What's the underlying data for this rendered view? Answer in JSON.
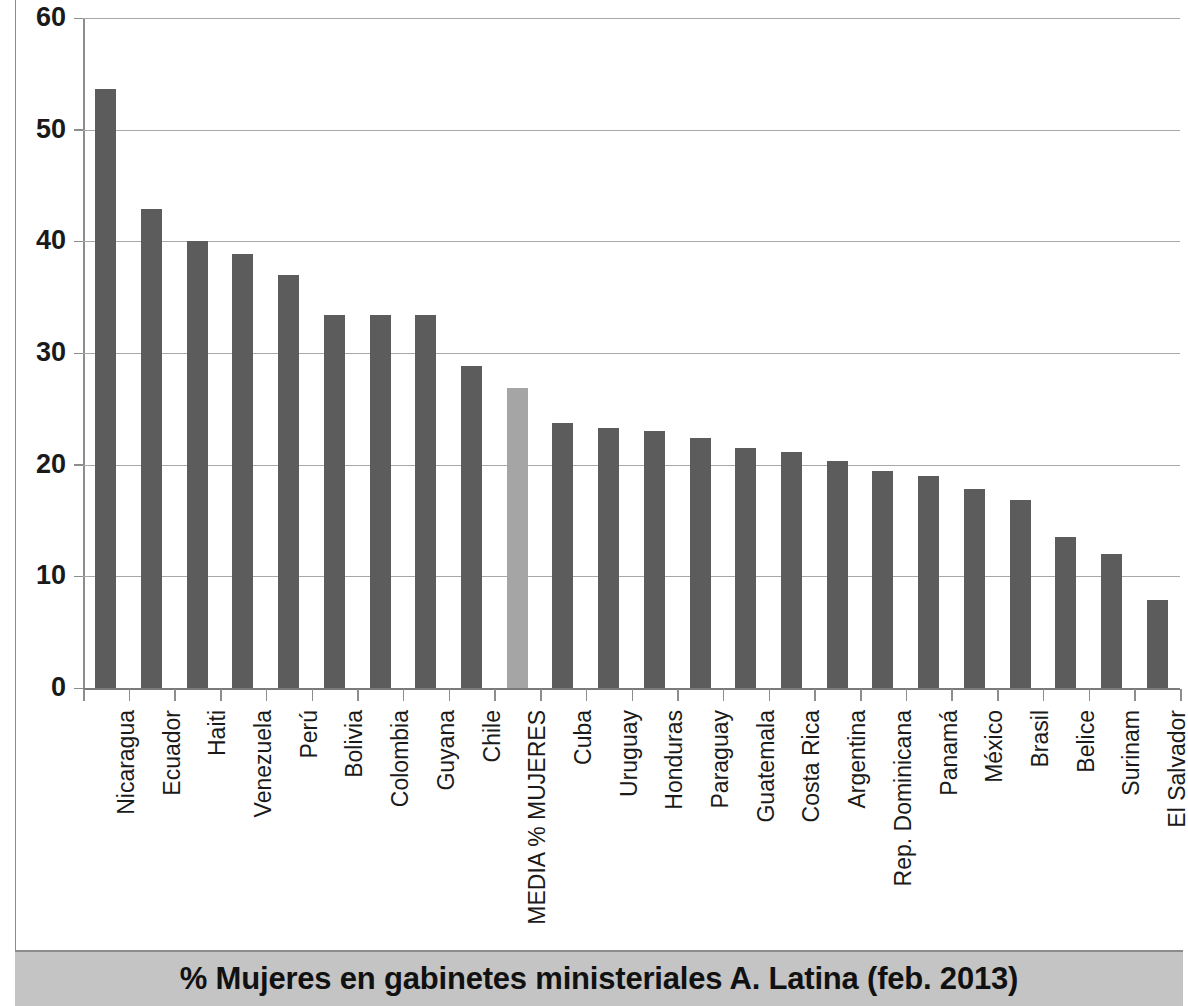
{
  "chart_data": {
    "type": "bar",
    "title": "% Mujeres en gabinetes ministeriales A. Latina (feb. 2013)",
    "xlabel": "",
    "ylabel": "",
    "ylim": [
      0,
      60
    ],
    "ytick_values": [
      0,
      10,
      20,
      30,
      40,
      50,
      60
    ],
    "ytick_labels": [
      "0",
      "10",
      "20",
      "30",
      "40",
      "50",
      "60"
    ],
    "grid": true,
    "legend": null,
    "highlight_category": "MEDIA % MUJERES",
    "colors": {
      "bar": "#5c5c5c",
      "bar_highlight": "#a5a5a5",
      "gridline": "#a8a8a8",
      "axis": "#8d8d8d",
      "title_band": "#c4c4c4",
      "text": "#1a1a1a"
    },
    "categories": [
      "Nicaragua",
      "Ecuador",
      "Haiti",
      "Venezuela",
      "Perú",
      "Bolivia",
      "Colombia",
      "Guyana",
      "Chile",
      "MEDIA % MUJERES",
      "Cuba",
      "Uruguay",
      "Honduras",
      "Paraguay",
      "Guatemala",
      "Costa Rica",
      "Argentina",
      "Rep. Dominicana",
      "Panamá",
      "México",
      "Brasil",
      "Belice",
      "Surinam",
      "El Salvador"
    ],
    "values": [
      53.6,
      42.9,
      40.0,
      38.9,
      37.0,
      33.4,
      33.4,
      33.4,
      28.8,
      26.9,
      23.7,
      23.3,
      23.0,
      22.4,
      21.5,
      21.1,
      20.3,
      19.4,
      19.0,
      17.8,
      16.8,
      13.5,
      12.0,
      7.9
    ]
  }
}
